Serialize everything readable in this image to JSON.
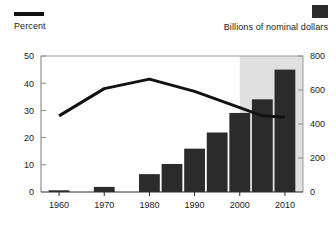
{
  "legend": {
    "left": {
      "label": "Percent",
      "marker": "line-swatch",
      "color": "#121212"
    },
    "right": {
      "label": "Billions of nominal dollars",
      "marker": "square-swatch",
      "color": "#2b2b2b"
    }
  },
  "chart_data": {
    "type": "bar",
    "title": "",
    "xlabel": "",
    "ylabel": "Percent",
    "y2label": "Billions of nominal dollars",
    "grid": false,
    "legend_position": "top",
    "x": [
      1960,
      1970,
      1980,
      1985,
      1990,
      1995,
      2000,
      2005,
      2010
    ],
    "categories": [
      "1960",
      "1970",
      "1980",
      "1985",
      "1990",
      "1995",
      "2000",
      "2005",
      "2010"
    ],
    "xticks": [
      "1960",
      "1970",
      "1980",
      "1990",
      "2000",
      "2010"
    ],
    "xtick_values": [
      1960,
      1970,
      1980,
      1990,
      2000,
      2010
    ],
    "xlim": [
      1956,
      2014
    ],
    "yticks": [
      "0",
      "10",
      "20",
      "30",
      "40",
      "50"
    ],
    "ytick_values": [
      0,
      10,
      20,
      30,
      40,
      50
    ],
    "ylim": [
      0,
      50
    ],
    "y2ticks": [
      "0",
      "200",
      "400",
      "600",
      "800"
    ],
    "y2tick_values": [
      0,
      200,
      400,
      600,
      800
    ],
    "y2lim": [
      0,
      800
    ],
    "shaded_region": {
      "from": 2000,
      "to": 2014,
      "color": "#e0e0e0"
    },
    "series": [
      {
        "name": "Billions of nominal dollars",
        "type": "bar",
        "axis": "right",
        "color": "#2b2b2b",
        "x": [
          1960,
          1970,
          1980,
          1985,
          1990,
          1995,
          2000,
          2005,
          2010
        ],
        "values": [
          10,
          30,
          105,
          165,
          255,
          350,
          465,
          545,
          720
        ]
      },
      {
        "name": "Percent",
        "type": "line",
        "axis": "left",
        "color": "#121212",
        "x": [
          1960,
          1970,
          1980,
          1990,
          2000,
          2005,
          2010
        ],
        "values": [
          28,
          38,
          41.5,
          37,
          31,
          28,
          27.5
        ]
      }
    ]
  }
}
